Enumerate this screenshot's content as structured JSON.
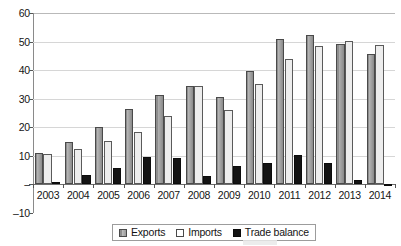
{
  "chart_data": {
    "type": "bar",
    "title": "",
    "xlabel": "",
    "ylabel": "",
    "categories": [
      "2003",
      "2004",
      "2005",
      "2006",
      "2007",
      "2008",
      "2009",
      "2010",
      "2011",
      "2012",
      "2013",
      "2014"
    ],
    "series": [
      {
        "name": "Exports",
        "color": "#9b9b9b",
        "values": [
          11.0,
          14.9,
          20.0,
          26.4,
          31.3,
          34.6,
          30.7,
          39.6,
          50.8,
          52.4,
          49.0,
          45.8
        ]
      },
      {
        "name": "Imports",
        "color": "#ededed",
        "values": [
          10.6,
          12.4,
          15.2,
          18.4,
          24.1,
          34.3,
          25.9,
          35.1,
          43.8,
          48.6,
          50.3,
          48.7
        ]
      },
      {
        "name": "Trade balance",
        "color": "#141414",
        "values": [
          0.9,
          3.2,
          5.6,
          9.5,
          9.1,
          3.1,
          6.4,
          7.5,
          10.2,
          7.4,
          1.5,
          -0.4
        ]
      }
    ],
    "ylim": [
      -10,
      60
    ],
    "ytick_labels": [
      "60",
      "50",
      "40",
      "30",
      "20",
      "10",
      "–",
      "–10"
    ],
    "ytick_values": [
      60,
      50,
      40,
      30,
      20,
      10,
      0,
      -10
    ],
    "grid": true,
    "legend_position": "bottom",
    "legend_entries": [
      "Exports",
      "Imports",
      "Trade balance"
    ]
  }
}
